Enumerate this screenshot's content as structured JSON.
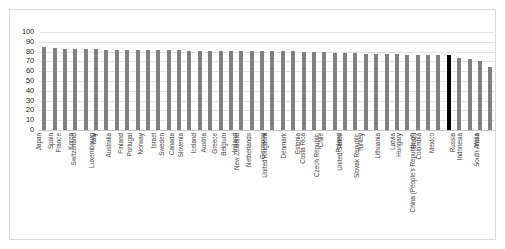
{
  "chart_data": {
    "type": "bar",
    "title": "",
    "xlabel": "",
    "ylabel": "",
    "ylim": [
      0,
      100
    ],
    "ytick_labels": [
      "100",
      "90",
      "80",
      "70",
      "60",
      "50",
      "40",
      "30",
      "20",
      "10",
      "0"
    ],
    "yticks": [
      100,
      90,
      80,
      70,
      60,
      50,
      40,
      30,
      20,
      10,
      0
    ],
    "grid": true,
    "legend": "none",
    "highlight_color": "#000000",
    "bar_color": "#808080",
    "highlighted_category": "China (People's Republic of)",
    "categories": [
      "Japan",
      "Spain",
      "France",
      "Korea",
      "Switzerland",
      "Italy",
      "Luxembourg",
      "Australia",
      "Finland",
      "Portugal",
      "Norway",
      "Israel",
      "Sweden",
      "Canada",
      "Slovenia",
      "Iceland",
      "Austria",
      "Greece",
      "Belgium",
      "Ireland",
      "New Zealand",
      "Netherlands",
      "Germany",
      "United Kingdom",
      "Denmark",
      "Estonia",
      "Costa Rica",
      "Chile",
      "Czech Republic",
      "Poland",
      "United States",
      "Turkey",
      "Slovak Republic",
      "Lithuania",
      "Latvia",
      "Hungary",
      "Brazil",
      "Colombia",
      "Mexico",
      "China (People's Republic of)",
      "Russia",
      "Indonesia",
      "India",
      "South Africa"
    ],
    "values": [
      85,
      84,
      83,
      83,
      83,
      83,
      82,
      82,
      82,
      82,
      82,
      82,
      82,
      82,
      81,
      81,
      81,
      81,
      81,
      81,
      81,
      81,
      81,
      81,
      81,
      80,
      80,
      80,
      79,
      79,
      79,
      78,
      78,
      78,
      78,
      77,
      77,
      77,
      77,
      77,
      73,
      72,
      70,
      64
    ]
  }
}
